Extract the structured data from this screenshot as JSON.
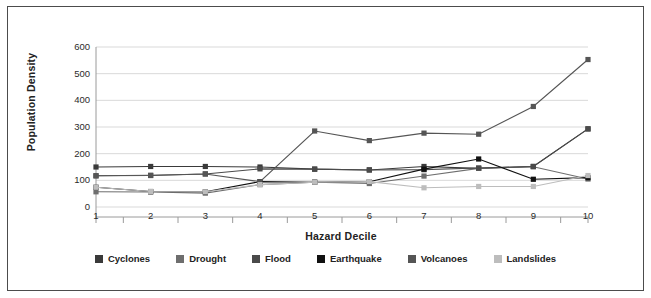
{
  "chart_data": {
    "type": "line",
    "title": "",
    "xlabel": "Hazard Decile",
    "ylabel": "Population Density",
    "categories": [
      "1",
      "2",
      "3",
      "4",
      "5",
      "6",
      "7",
      "8",
      "9",
      "10"
    ],
    "xlim": [
      1,
      10
    ],
    "ylim": [
      0,
      600
    ],
    "ytick_labels": [
      "0",
      "100",
      "200",
      "300",
      "400",
      "500",
      "600"
    ],
    "ytick_values": [
      0,
      100,
      200,
      300,
      400,
      500,
      600
    ],
    "grid": "horizontal",
    "legend_position": "bottom",
    "series": [
      {
        "name": "Cyclones",
        "color": "#3a3a3a",
        "marker": "square",
        "values": [
          150,
          152,
          152,
          150,
          142,
          139,
          152,
          145,
          152,
          293
        ]
      },
      {
        "name": "Drought",
        "color": "#6e6e6e",
        "marker": "square",
        "values": [
          57,
          56,
          52,
          84,
          93,
          88,
          116,
          145,
          151,
          105
        ]
      },
      {
        "name": "Flood",
        "color": "#4a4a4a",
        "marker": "square",
        "values": [
          117,
          118,
          124,
          143,
          142,
          139,
          140,
          146,
          152,
          293
        ]
      },
      {
        "name": "Earthquake",
        "color": "#111111",
        "marker": "square",
        "values": [
          74,
          58,
          57,
          95,
          93,
          95,
          142,
          180,
          104,
          110
        ]
      },
      {
        "name": "Volcanoes",
        "color": "#555555",
        "marker": "square",
        "values": [
          117,
          119,
          124,
          95,
          285,
          249,
          277,
          273,
          377,
          553
        ]
      },
      {
        "name": "Landslides",
        "color": "#bdbdbd",
        "marker": "square",
        "values": [
          74,
          58,
          57,
          84,
          93,
          95,
          72,
          77,
          77,
          118
        ]
      }
    ]
  },
  "legend": {
    "items": [
      {
        "label": "Cyclones",
        "color": "#3a3a3a"
      },
      {
        "label": "Drought",
        "color": "#6e6e6e"
      },
      {
        "label": "Flood",
        "color": "#4a4a4a"
      },
      {
        "label": "Earthquake",
        "color": "#111111"
      },
      {
        "label": "Volcanoes",
        "color": "#555555"
      },
      {
        "label": "Landslides",
        "color": "#bdbdbd"
      }
    ]
  },
  "style": {
    "border_color": "#4c4c4c",
    "grid_color": "#d9d9d9",
    "axis_color": "#9a9a9a",
    "background": "#ffffff",
    "text_color": "#222222"
  }
}
